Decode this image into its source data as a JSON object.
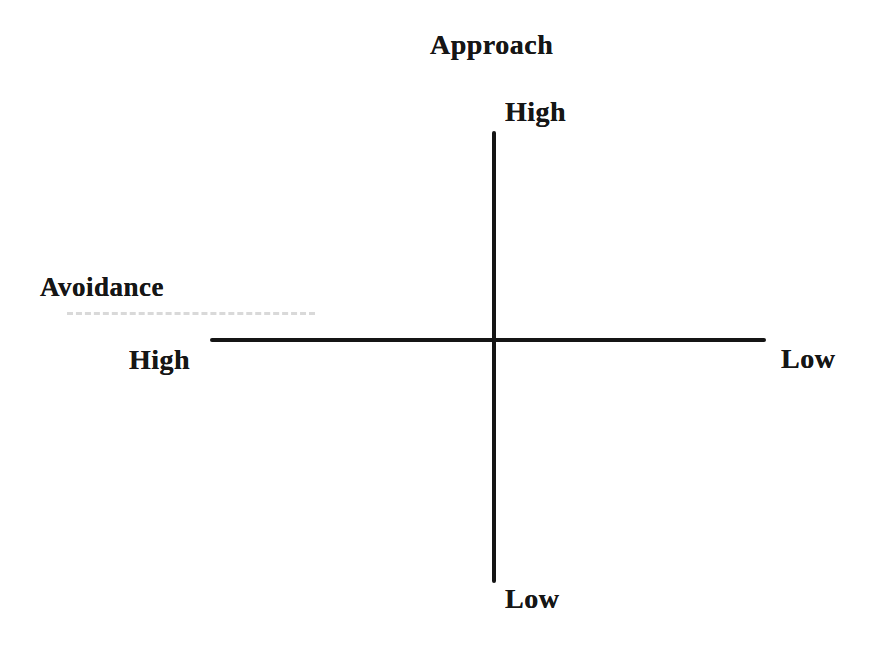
{
  "diagram": {
    "type": "two-axis quadrant diagram",
    "vertical_axis": {
      "title": "Approach",
      "top_label": "High",
      "bottom_label": "Low"
    },
    "horizontal_axis": {
      "title": "Avoidance",
      "left_label": "High",
      "right_label": "Low"
    },
    "line_color": "#151515",
    "background_color": "#ffffff",
    "text_color": "#161616"
  }
}
